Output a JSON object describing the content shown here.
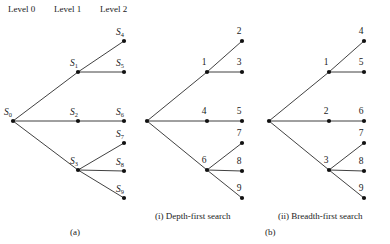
{
  "figure": {
    "panel_a_caption": "(a)",
    "panel_b_caption": "(b)",
    "level_headers": [
      {
        "text": "Level 0",
        "x": 8,
        "y": 12
      },
      {
        "text": "Level 1",
        "x": 54,
        "y": 12
      },
      {
        "text": "Level 2",
        "x": 100,
        "y": 12
      }
    ]
  },
  "tree_a": {
    "name": "state-space-tree",
    "nodes": [
      {
        "id": "S0",
        "letter": "S",
        "sub": "0",
        "x": 13,
        "y": 121,
        "label_x": 4,
        "label_y": 115,
        "label_anchor": "start"
      },
      {
        "id": "S1",
        "letter": "S",
        "sub": "1",
        "x": 78,
        "y": 72,
        "label_x": 70,
        "label_y": 66,
        "label_anchor": "start"
      },
      {
        "id": "S2",
        "letter": "S",
        "sub": "2",
        "x": 78,
        "y": 121,
        "label_x": 70,
        "label_y": 115,
        "label_anchor": "start"
      },
      {
        "id": "S3",
        "letter": "S",
        "sub": "3",
        "x": 78,
        "y": 170,
        "label_x": 70,
        "label_y": 164,
        "label_anchor": "start"
      },
      {
        "id": "S4",
        "letter": "S",
        "sub": "4",
        "x": 124,
        "y": 41,
        "label_x": 116,
        "label_y": 35,
        "label_anchor": "start"
      },
      {
        "id": "S5",
        "letter": "S",
        "sub": "5",
        "x": 124,
        "y": 72,
        "label_x": 116,
        "label_y": 66,
        "label_anchor": "start"
      },
      {
        "id": "S6",
        "letter": "S",
        "sub": "6",
        "x": 124,
        "y": 121,
        "label_x": 116,
        "label_y": 115,
        "label_anchor": "start"
      },
      {
        "id": "S7",
        "letter": "S",
        "sub": "7",
        "x": 124,
        "y": 143,
        "label_x": 116,
        "label_y": 137,
        "label_anchor": "start"
      },
      {
        "id": "S8",
        "letter": "S",
        "sub": "8",
        "x": 124,
        "y": 171,
        "label_x": 116,
        "label_y": 165,
        "label_anchor": "start"
      },
      {
        "id": "S9",
        "letter": "S",
        "sub": "9",
        "x": 124,
        "y": 198,
        "label_x": 116,
        "label_y": 192,
        "label_anchor": "start"
      }
    ],
    "edges": [
      {
        "from": "S0",
        "to": "S1"
      },
      {
        "from": "S0",
        "to": "S2"
      },
      {
        "from": "S0",
        "to": "S3"
      },
      {
        "from": "S1",
        "to": "S4"
      },
      {
        "from": "S1",
        "to": "S5"
      },
      {
        "from": "S2",
        "to": "S6"
      },
      {
        "from": "S3",
        "to": "S7"
      },
      {
        "from": "S3",
        "to": "S8"
      },
      {
        "from": "S3",
        "to": "S9"
      }
    ]
  },
  "tree_dfs": {
    "name": "depth-first-search-tree",
    "caption": "(i) Depth-first search",
    "caption_x": 155,
    "caption_y": 219,
    "nodes": [
      {
        "id": "R",
        "text": "",
        "x": 147,
        "y": 121,
        "label_x": 147,
        "label_y": 113
      },
      {
        "id": "N1",
        "text": "1",
        "x": 207,
        "y": 72,
        "label_x": 204,
        "label_y": 65
      },
      {
        "id": "N4",
        "text": "4",
        "x": 207,
        "y": 121,
        "label_x": 204,
        "label_y": 114
      },
      {
        "id": "N6",
        "text": "6",
        "x": 207,
        "y": 170,
        "label_x": 204,
        "label_y": 163
      },
      {
        "id": "N2",
        "text": "2",
        "x": 242,
        "y": 41,
        "label_x": 239,
        "label_y": 34
      },
      {
        "id": "N3",
        "text": "3",
        "x": 242,
        "y": 72,
        "label_x": 239,
        "label_y": 65
      },
      {
        "id": "N5",
        "text": "5",
        "x": 242,
        "y": 121,
        "label_x": 239,
        "label_y": 114
      },
      {
        "id": "N7",
        "text": "7",
        "x": 242,
        "y": 143,
        "label_x": 239,
        "label_y": 136
      },
      {
        "id": "N8",
        "text": "8",
        "x": 242,
        "y": 171,
        "label_x": 239,
        "label_y": 164
      },
      {
        "id": "N9",
        "text": "9",
        "x": 242,
        "y": 198,
        "label_x": 239,
        "label_y": 191
      }
    ],
    "edges": [
      {
        "from": "R",
        "to": "N1"
      },
      {
        "from": "R",
        "to": "N4"
      },
      {
        "from": "R",
        "to": "N6"
      },
      {
        "from": "N1",
        "to": "N2"
      },
      {
        "from": "N1",
        "to": "N3"
      },
      {
        "from": "N4",
        "to": "N5"
      },
      {
        "from": "N6",
        "to": "N7"
      },
      {
        "from": "N6",
        "to": "N8"
      },
      {
        "from": "N6",
        "to": "N9"
      }
    ]
  },
  "tree_bfs": {
    "name": "breadth-first-search-tree",
    "caption": "(ii) Breadth-first search",
    "caption_x": 278,
    "caption_y": 219,
    "nodes": [
      {
        "id": "R",
        "text": "",
        "x": 269,
        "y": 121,
        "label_x": 269,
        "label_y": 113
      },
      {
        "id": "N1",
        "text": "1",
        "x": 329,
        "y": 72,
        "label_x": 326,
        "label_y": 65
      },
      {
        "id": "N2",
        "text": "2",
        "x": 329,
        "y": 121,
        "label_x": 326,
        "label_y": 114
      },
      {
        "id": "N3",
        "text": "3",
        "x": 329,
        "y": 170,
        "label_x": 326,
        "label_y": 163
      },
      {
        "id": "N4",
        "text": "4",
        "x": 364,
        "y": 41,
        "label_x": 361,
        "label_y": 34
      },
      {
        "id": "N5",
        "text": "5",
        "x": 364,
        "y": 72,
        "label_x": 361,
        "label_y": 65
      },
      {
        "id": "N6",
        "text": "6",
        "x": 364,
        "y": 121,
        "label_x": 361,
        "label_y": 114
      },
      {
        "id": "N7",
        "text": "7",
        "x": 364,
        "y": 143,
        "label_x": 361,
        "label_y": 136
      },
      {
        "id": "N8",
        "text": "8",
        "x": 364,
        "y": 171,
        "label_x": 361,
        "label_y": 164
      },
      {
        "id": "N9",
        "text": "9",
        "x": 364,
        "y": 198,
        "label_x": 361,
        "label_y": 191
      }
    ],
    "edges": [
      {
        "from": "R",
        "to": "N1"
      },
      {
        "from": "R",
        "to": "N2"
      },
      {
        "from": "R",
        "to": "N3"
      },
      {
        "from": "N1",
        "to": "N4"
      },
      {
        "from": "N1",
        "to": "N5"
      },
      {
        "from": "N2",
        "to": "N6"
      },
      {
        "from": "N3",
        "to": "N7"
      },
      {
        "from": "N3",
        "to": "N8"
      },
      {
        "from": "N3",
        "to": "N9"
      }
    ]
  },
  "captions": {
    "a": {
      "text": "(a)",
      "x": 70,
      "y": 235
    },
    "b": {
      "text": "(b)",
      "x": 265,
      "y": 235
    }
  },
  "style": {
    "edge_color": "#2b2b2b",
    "node_color": "#111111",
    "text_color": "#1a1a1a",
    "background": "#ffffff",
    "node_radius": 2.1
  }
}
